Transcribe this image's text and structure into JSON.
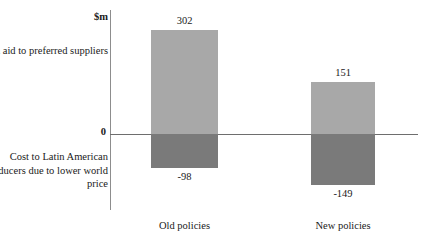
{
  "chart_data": {
    "type": "bar",
    "title": "",
    "xlabel": "",
    "ylabel": "$m",
    "grid": false,
    "legend_position": "none",
    "stacked": true,
    "diverging": true,
    "categories": [
      "Old policies",
      "New policies"
    ],
    "series": [
      {
        "name": "Banana aid to preferred suppliers",
        "values": [
          302,
          151
        ],
        "color": "#a8a8a8"
      },
      {
        "name": "Cost to Latin American producers due to lower world price",
        "values": [
          -98,
          -149
        ],
        "color": "#7a7a7a"
      }
    ],
    "value_labels": {
      "positive": [
        "302",
        "151"
      ],
      "negative": [
        "-98",
        "-149"
      ]
    },
    "zero_label": "0",
    "ylim": [
      -160,
      320
    ]
  },
  "axis": {
    "unit_label": "$m",
    "zero_label": "0"
  },
  "captions": {
    "positive": "Banana aid to preferred suppliers",
    "negative": "Cost to Latin American producers due to lower world price"
  },
  "colors": {
    "positive_bar": "#a8a8a8",
    "negative_bar": "#7a7a7a",
    "axis_line": "#6e6e6e",
    "background": "#ffffff"
  }
}
